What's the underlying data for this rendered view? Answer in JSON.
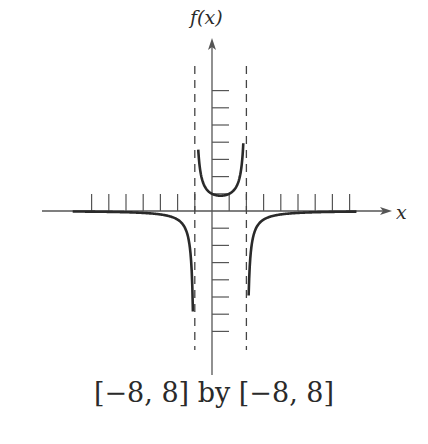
{
  "chart_data": {
    "type": "line",
    "title": "",
    "xlabel": "x",
    "ylabel": "f(x)",
    "caption": "[−8, 8] by [−8, 8]",
    "xlim": [
      -8,
      8
    ],
    "ylim": [
      -8,
      8
    ],
    "x_tick_step": 1,
    "y_tick_step": 1,
    "grid": false,
    "vertical_asymptotes": [
      -1,
      2
    ],
    "horizontal_asymptote": 0,
    "series": [
      {
        "name": "left branch",
        "x": [
          -8,
          -6,
          -4,
          -3,
          -2,
          -1.5,
          -1.2,
          -1.1
        ],
        "y": [
          -0.04,
          -0.06,
          -0.11,
          -0.2,
          -0.5,
          -1.14,
          -2.8,
          -5.9
        ]
      },
      {
        "name": "middle branch",
        "x": [
          -0.8,
          -0.6,
          -0.4,
          -0.2,
          0,
          0.5,
          1,
          1.4,
          1.6,
          1.75
        ],
        "y": [
          3.6,
          1.92,
          1.39,
          1.14,
          1.0,
          0.89,
          1.0,
          1.39,
          1.92,
          3.2
        ]
      },
      {
        "name": "right branch",
        "x": [
          2.15,
          2.3,
          2.5,
          3,
          4,
          6,
          8
        ],
        "y": [
          -4.2,
          -2.02,
          -1.14,
          -0.5,
          -0.2,
          -0.07,
          -0.04
        ]
      }
    ],
    "colors": {
      "curve": "#2a2a2a",
      "axes": "#555555",
      "asymptote": "#444444"
    }
  },
  "labels": {
    "y_axis": "f(x)",
    "x_axis": "x",
    "caption": "[−8, 8] by [−8, 8]"
  }
}
